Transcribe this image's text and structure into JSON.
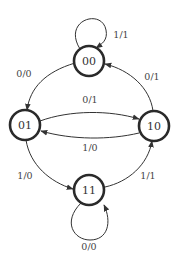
{
  "diagram": {
    "type": "state-machine",
    "states": [
      {
        "id": "00",
        "label": "00"
      },
      {
        "id": "01",
        "label": "01"
      },
      {
        "id": "10",
        "label": "10"
      },
      {
        "id": "11",
        "label": "11"
      }
    ],
    "transitions": [
      {
        "from": "00",
        "to": "00",
        "label": "1/1"
      },
      {
        "from": "00",
        "to": "01",
        "label": "0/0"
      },
      {
        "from": "01",
        "to": "10",
        "label": "0/1"
      },
      {
        "from": "10",
        "to": "01",
        "label": "1/0"
      },
      {
        "from": "10",
        "to": "00",
        "label": "0/1"
      },
      {
        "from": "01",
        "to": "11",
        "label": "1/0"
      },
      {
        "from": "11",
        "to": "10",
        "label": "1/1"
      },
      {
        "from": "11",
        "to": "11",
        "label": "0/0"
      }
    ]
  }
}
